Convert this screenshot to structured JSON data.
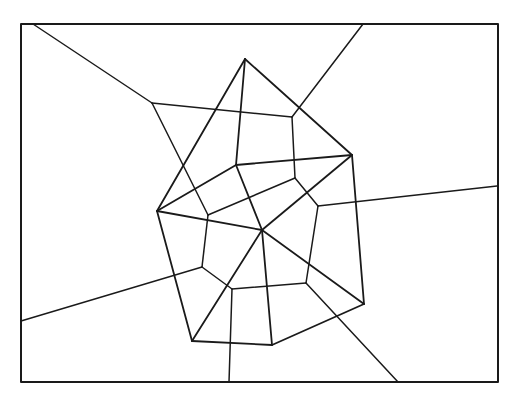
{
  "diagram": {
    "type": "voronoi-delaunay",
    "stroke_color": "#1a1a1a",
    "background": "#ffffff",
    "frame": {
      "x": 21,
      "y": 24,
      "width": 477,
      "height": 358,
      "stroke_width": 2
    },
    "sites": [
      {
        "id": "A",
        "x": 245,
        "y": 59
      },
      {
        "id": "B",
        "x": 352,
        "y": 155
      },
      {
        "id": "C",
        "x": 157,
        "y": 211
      },
      {
        "id": "D",
        "x": 236,
        "y": 165
      },
      {
        "id": "E",
        "x": 262,
        "y": 230
      },
      {
        "id": "F",
        "x": 364,
        "y": 304
      },
      {
        "id": "G",
        "x": 192,
        "y": 341
      },
      {
        "id": "H",
        "x": 272,
        "y": 345
      }
    ],
    "delaunay_edges": [
      [
        245,
        59,
        352,
        155
      ],
      [
        245,
        59,
        157,
        211
      ],
      [
        245,
        59,
        236,
        165
      ],
      [
        236,
        165,
        352,
        155
      ],
      [
        157,
        211,
        236,
        165
      ],
      [
        236,
        165,
        262,
        230
      ],
      [
        157,
        211,
        262,
        230
      ],
      [
        262,
        230,
        364,
        304
      ],
      [
        352,
        155,
        262,
        230
      ],
      [
        262,
        230,
        192,
        341
      ],
      [
        352,
        155,
        364,
        304
      ],
      [
        364,
        304,
        272,
        345
      ],
      [
        262,
        230,
        272,
        345
      ],
      [
        157,
        211,
        192,
        341
      ],
      [
        192,
        341,
        272,
        345
      ]
    ],
    "voronoi_edges": [
      [
        33,
        24,
        152,
        103
      ],
      [
        152,
        103,
        292,
        117
      ],
      [
        152,
        103,
        208,
        215
      ],
      [
        292,
        117,
        363,
        24
      ],
      [
        292,
        117,
        295,
        178
      ],
      [
        208,
        215,
        295,
        178
      ],
      [
        295,
        178,
        318,
        206
      ],
      [
        318,
        206,
        497,
        186
      ],
      [
        318,
        206,
        306,
        283
      ],
      [
        208,
        215,
        202,
        267
      ],
      [
        202,
        267,
        21,
        321
      ],
      [
        202,
        267,
        232,
        289
      ],
      [
        232,
        289,
        306,
        283
      ],
      [
        232,
        289,
        229,
        382
      ],
      [
        306,
        283,
        398,
        382
      ]
    ]
  }
}
